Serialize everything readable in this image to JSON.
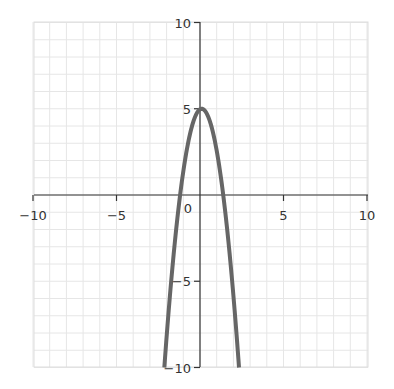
{
  "chart_data": {
    "type": "line",
    "title": "",
    "xlabel": "",
    "ylabel": "",
    "xlim": [
      -10,
      10
    ],
    "ylim": [
      -10,
      10
    ],
    "grid": true,
    "grid_step": 1,
    "x_ticks": [
      -10,
      -5,
      5,
      10
    ],
    "y_ticks": [
      10,
      5,
      -5,
      -10
    ],
    "origin_label": "0",
    "series": [
      {
        "name": "parabola",
        "equation": "y = -3(x - 0.1)^2 + 5",
        "color": "#666666",
        "vertex": [
          0.1,
          5
        ],
        "x": [
          -2.14,
          -2.0,
          -1.5,
          -1.19,
          -1.0,
          -0.5,
          0.0,
          0.1,
          0.5,
          1.0,
          1.39,
          1.5,
          2.0,
          2.34
        ],
        "y": [
          -10,
          -8.83,
          -3.68,
          0,
          1.37,
          3.92,
          4.97,
          5,
          4.52,
          2.57,
          0,
          -0.88,
          -5.83,
          -10
        ]
      }
    ]
  },
  "labels": {
    "x_ticks": [
      "−10",
      "−5",
      "5",
      "10"
    ],
    "y_ticks": [
      "10",
      "5",
      "−5",
      "−10"
    ],
    "origin": "0"
  },
  "colors": {
    "axis": "#333333",
    "grid": "#e6e6e6",
    "curve": "#666666",
    "background": "#ffffff"
  }
}
